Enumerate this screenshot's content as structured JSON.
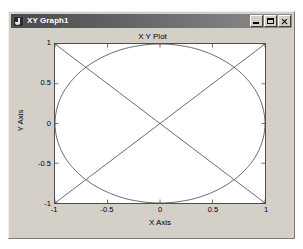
{
  "window": {
    "title": "XY Graph1",
    "icon": "app-note-icon",
    "buttons": {
      "minimize": "minimize-icon",
      "maximize": "maximize-icon",
      "close": "close-icon"
    }
  },
  "chart_data": {
    "type": "line",
    "title": "X Y Plot",
    "xlabel": "X Axis",
    "ylabel": "Y Axis",
    "xlim": [
      -1,
      1
    ],
    "ylim": [
      -1,
      1
    ],
    "xticks": [
      -1,
      -0.5,
      0,
      0.5,
      1
    ],
    "yticks": [
      -1,
      -0.5,
      0,
      0.5,
      1
    ],
    "xticklabels": [
      "-1",
      "-0.5",
      "0",
      "0.5",
      "1"
    ],
    "yticklabels": [
      "-1",
      "-0.5",
      "0",
      "0.5",
      "1"
    ],
    "grid": false,
    "legend": null,
    "series": [
      {
        "name": "circle",
        "comment": "unit circle traced counter-clockwise, x=cos(t), y=sin(t)",
        "x": [
          1.0,
          0.924,
          0.707,
          0.383,
          0.0,
          -0.383,
          -0.707,
          -0.924,
          -1.0,
          -0.924,
          -0.707,
          -0.383,
          0.0,
          0.383,
          0.707,
          0.924,
          1.0
        ],
        "y": [
          0.0,
          0.383,
          0.707,
          0.924,
          1.0,
          0.924,
          0.707,
          0.383,
          0.0,
          -0.383,
          -0.707,
          -0.924,
          -1.0,
          -0.924,
          -0.707,
          -0.383,
          0.0
        ]
      },
      {
        "name": "diagonal-down",
        "comment": "straight line from top-left to bottom-right",
        "x": [
          -1.0,
          1.0
        ],
        "y": [
          1.0,
          -1.0
        ]
      },
      {
        "name": "diagonal-up",
        "comment": "straight line from bottom-left to top-right",
        "x": [
          -1.0,
          1.0
        ],
        "y": [
          -1.0,
          1.0
        ]
      }
    ],
    "colors": {
      "axes": "#4d4d4d",
      "curve": "#595959",
      "background": "#ffffff",
      "figure_background": "#d4d0c8"
    }
  }
}
